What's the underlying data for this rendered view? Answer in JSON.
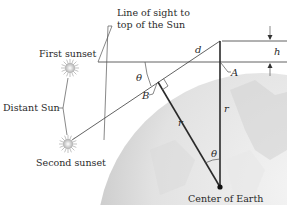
{
  "figure": {
    "labels": {
      "line_of_sight_1": "Line of sight to",
      "line_of_sight_2": "top of the Sun",
      "first_sunset": "First sunset",
      "distant_sun": "Distant Sun",
      "second_sunset": "Second sunset",
      "center_of_earth": "Center of Earth"
    },
    "variables": {
      "d": "d",
      "h": "h",
      "A": "A",
      "B": "B",
      "r_left": "r",
      "r_right": "r",
      "theta_top": "θ",
      "theta_center": "θ"
    },
    "icons": {
      "sun": "sun-burst-icon",
      "arrow": "arrow-icon"
    },
    "colors": {
      "earth_light": "#f2f2f2",
      "earth_dark": "#b8b8b8",
      "line": "#3a3a3a",
      "sun": "#c8c8c8"
    }
  }
}
